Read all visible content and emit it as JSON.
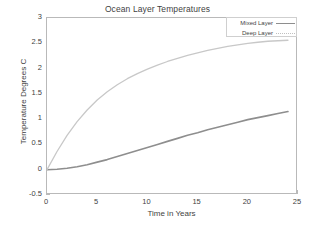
{
  "chart_data": {
    "type": "line",
    "title": "Ocean Layer Temperatures",
    "xlabel": "Time in Years",
    "ylabel": "Temperature Degrees C",
    "xlim": [
      0,
      25
    ],
    "ylim": [
      -0.5,
      3
    ],
    "grid": false,
    "legend_position": "top-right",
    "xticks": [
      "0",
      "5",
      "10",
      "15",
      "20",
      "25"
    ],
    "xtick_values": [
      0,
      5,
      10,
      15,
      20,
      25
    ],
    "yticks": [
      "-0.5",
      "0",
      "0.5",
      "1",
      "1.5",
      "2",
      "2.5",
      "3"
    ],
    "ytick_values": [
      -0.5,
      0,
      0.5,
      1,
      1.5,
      2,
      2.5,
      3
    ],
    "x": [
      0,
      1,
      2,
      3,
      4,
      5,
      6,
      7,
      8,
      9,
      10,
      11,
      12,
      13,
      14,
      15,
      16,
      17,
      18,
      19,
      20,
      21,
      22,
      23,
      24
    ],
    "series": [
      {
        "name": "Mixed Layer",
        "color": "#8e8e8e",
        "style": "solid",
        "values": [
          0.0,
          0.01,
          0.03,
          0.06,
          0.1,
          0.15,
          0.2,
          0.26,
          0.32,
          0.38,
          0.44,
          0.5,
          0.56,
          0.62,
          0.68,
          0.73,
          0.79,
          0.84,
          0.89,
          0.94,
          0.99,
          1.03,
          1.07,
          1.11,
          1.15
        ]
      },
      {
        "name": "Deep Layer",
        "color": "#c8c8c8",
        "style": "dotted",
        "values": [
          0.0,
          0.36,
          0.68,
          0.95,
          1.18,
          1.38,
          1.54,
          1.68,
          1.8,
          1.9,
          1.99,
          2.07,
          2.14,
          2.2,
          2.26,
          2.31,
          2.36,
          2.4,
          2.44,
          2.47,
          2.5,
          2.52,
          2.54,
          2.55,
          2.56
        ]
      }
    ]
  },
  "legend": {
    "entries": [
      {
        "label": "Mixed Layer"
      },
      {
        "label": "Deep Layer"
      }
    ]
  }
}
